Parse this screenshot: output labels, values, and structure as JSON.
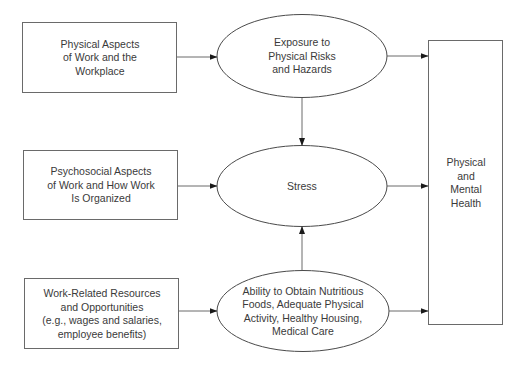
{
  "diagram": {
    "type": "flow",
    "colors": {
      "background": "#ffffff",
      "stroke": "#5a5a5a",
      "text": "#3a3a3a"
    },
    "nodes": {
      "physical_aspects": {
        "shape": "rectangle",
        "label": "Physical Aspects\nof Work and the\nWorkplace"
      },
      "psychosocial_aspects": {
        "shape": "rectangle",
        "label": "Psychosocial Aspects\nof Work and How Work\nIs Organized"
      },
      "work_resources": {
        "shape": "rectangle",
        "label": "Work-Related Resources\nand Opportunities\n(e.g., wages and salaries,\nemployee benefits)"
      },
      "exposure": {
        "shape": "ellipse",
        "label": "Exposure to\nPhysical Risks\nand Hazards"
      },
      "stress": {
        "shape": "ellipse",
        "label": "Stress"
      },
      "ability": {
        "shape": "ellipse",
        "label": "Ability to Obtain Nutritious\nFoods, Adequate Physical\nActivity, Healthy Housing,\nMedical Care"
      },
      "health": {
        "shape": "rectangle",
        "label": "Physical\nand\nMental\nHealth"
      }
    },
    "edges": [
      {
        "from": "physical_aspects",
        "to": "exposure"
      },
      {
        "from": "psychosocial_aspects",
        "to": "stress"
      },
      {
        "from": "work_resources",
        "to": "ability"
      },
      {
        "from": "exposure",
        "to": "stress"
      },
      {
        "from": "ability",
        "to": "stress"
      },
      {
        "from": "exposure",
        "to": "health"
      },
      {
        "from": "stress",
        "to": "health"
      },
      {
        "from": "ability",
        "to": "health"
      }
    ]
  }
}
